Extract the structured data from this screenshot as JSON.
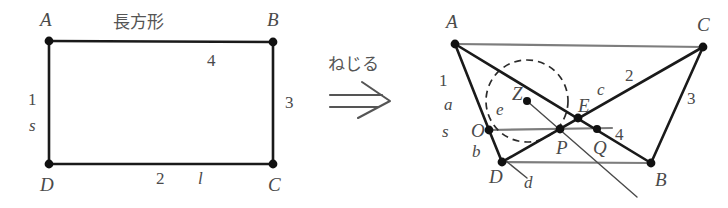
{
  "figure": {
    "caption_left": "長方形",
    "transform_label": "ねじる",
    "arrow_glyph": "double-right-arrow"
  },
  "left_diagram": {
    "name": "rectangle-ABCD",
    "title": "長方形",
    "vertices": [
      {
        "id": "A",
        "label": "A",
        "x": 49,
        "y": 41
      },
      {
        "id": "B",
        "label": "B",
        "x": 273,
        "y": 42
      },
      {
        "id": "C",
        "label": "C",
        "x": 273,
        "y": 164
      },
      {
        "id": "D",
        "label": "D",
        "x": 49,
        "y": 164
      }
    ],
    "vertex_labels": [
      {
        "text": "A",
        "x": 40,
        "y": 26
      },
      {
        "text": "B",
        "x": 267,
        "y": 26
      },
      {
        "text": "C",
        "x": 268,
        "y": 191
      },
      {
        "text": "D",
        "x": 40,
        "y": 191
      }
    ],
    "edge_labels": [
      {
        "text": "4",
        "x": 207,
        "y": 66,
        "style": "num"
      },
      {
        "text": "3",
        "x": 285,
        "y": 108,
        "style": "num"
      },
      {
        "text": "1",
        "x": 28,
        "y": 105,
        "style": "num"
      },
      {
        "text": "s",
        "x": 29,
        "y": 131,
        "style": "var"
      },
      {
        "text": "2",
        "x": 156,
        "y": 184,
        "style": "num"
      },
      {
        "text": "l",
        "x": 198,
        "y": 184,
        "style": "var"
      }
    ]
  },
  "right_diagram": {
    "name": "twisted-quadrilateral",
    "vertices": [
      {
        "id": "A",
        "label": "A",
        "x": 455,
        "y": 44
      },
      {
        "id": "C",
        "label": "C",
        "x": 703,
        "y": 47
      },
      {
        "id": "B",
        "label": "B",
        "x": 651,
        "y": 163
      },
      {
        "id": "D",
        "label": "D",
        "x": 502,
        "y": 162
      },
      {
        "id": "O",
        "label": "O",
        "x": 489,
        "y": 130
      },
      {
        "id": "Z",
        "label": "Z",
        "x": 527,
        "y": 101
      },
      {
        "id": "E",
        "label": "E",
        "x": 578,
        "y": 118
      },
      {
        "id": "P",
        "label": "P",
        "x": 560,
        "y": 129
      },
      {
        "id": "Q",
        "label": "Q",
        "x": 597,
        "y": 129
      }
    ],
    "vertex_labels": [
      {
        "text": "A",
        "x": 446,
        "y": 28
      },
      {
        "text": "C",
        "x": 697,
        "y": 31
      },
      {
        "text": "B",
        "x": 655,
        "y": 186
      },
      {
        "text": "D",
        "x": 489,
        "y": 183
      },
      {
        "text": "O",
        "x": 471,
        "y": 137
      },
      {
        "text": "Z",
        "x": 512,
        "y": 100
      },
      {
        "text": "E",
        "x": 578,
        "y": 112
      },
      {
        "text": "P",
        "x": 556,
        "y": 154
      },
      {
        "text": "Q",
        "x": 593,
        "y": 154
      }
    ],
    "edge_labels": [
      {
        "text": "1",
        "x": 439,
        "y": 86,
        "style": "num"
      },
      {
        "text": "a",
        "x": 444,
        "y": 110,
        "style": "var"
      },
      {
        "text": "s",
        "x": 442,
        "y": 137,
        "style": "var"
      },
      {
        "text": "b",
        "x": 472,
        "y": 157,
        "style": "var"
      },
      {
        "text": "e",
        "x": 496,
        "y": 115,
        "style": "var"
      },
      {
        "text": "d",
        "x": 524,
        "y": 188,
        "style": "var"
      },
      {
        "text": "c",
        "x": 597,
        "y": 95,
        "style": "var"
      },
      {
        "text": "2",
        "x": 625,
        "y": 81,
        "style": "num"
      },
      {
        "text": "3",
        "x": 687,
        "y": 104,
        "style": "num"
      },
      {
        "text": "4",
        "x": 615,
        "y": 140,
        "style": "num"
      }
    ],
    "dashed_circle": {
      "cx": 527,
      "cy": 101,
      "r": 41
    }
  }
}
